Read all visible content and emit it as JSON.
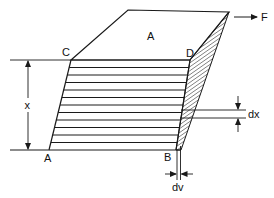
{
  "figure": {
    "labels": {
      "top_face": "A",
      "corner_top_left": "C",
      "corner_top_right": "D",
      "corner_bottom_left": "A",
      "corner_bottom_right": "B",
      "height": "x",
      "layer_thickness": "dx",
      "layer_displacement": "dv",
      "force": "F"
    },
    "layer_count": 12,
    "colors": {
      "stroke": "#1a1a1a",
      "background": "#ffffff"
    }
  }
}
